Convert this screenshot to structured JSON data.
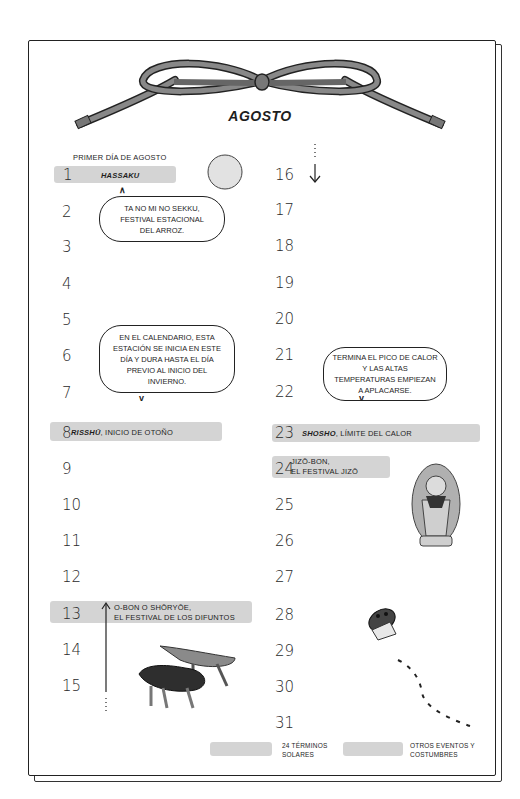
{
  "header": {
    "month": "AGOSTO"
  },
  "left_column": {
    "first_day_note": "PRIMER DÍA DE AGOSTO",
    "days": [
      "1",
      "2",
      "3",
      "4",
      "5",
      "6",
      "7",
      "8",
      "9",
      "10",
      "11",
      "12",
      "13",
      "14",
      "15"
    ],
    "events": {
      "day1": "HASSAKU",
      "day8_name": "RISSHŪ",
      "day8_rest": ", INICIO DE OTOÑO",
      "day13_line1": "O-BON O SHŌRYŌE,",
      "day13_line2": "EL FESTIVAL DE LOS DIFUNTOS"
    },
    "bubbles": {
      "hassaku": "TA NO MI NO SEKKU, FESTIVAL ESTACIONAL DEL ARROZ.",
      "risshu": "EN EL CALENDARIO, ESTA ESTACIÓN SE INICIA EN ESTE DÍA Y DURA HASTA EL DÍA PREVIO AL INICIO DEL INVIERNO."
    }
  },
  "right_column": {
    "days": [
      "16",
      "17",
      "18",
      "19",
      "20",
      "21",
      "22",
      "23",
      "24",
      "25",
      "26",
      "27",
      "28",
      "29",
      "30",
      "31"
    ],
    "events": {
      "day23_name": "SHOSHO",
      "day23_rest": ", LÍMITE DEL CALOR",
      "day24_line1": "JIZŌ-BON,",
      "day24_line2": "EL FESTIVAL JIZŌ"
    },
    "bubbles": {
      "shosho": "TERMINA EL PICO DE CALOR Y LAS ALTAS TEMPERATURAS EMPIEZAN A APLACARSE."
    }
  },
  "legend": {
    "item1": "24 TÉRMINOS SOLARES",
    "item2": "OTROS EVENTOS Y COSTUMBRES"
  },
  "colors": {
    "highlight": "#cfcfcf",
    "rope": "#777777",
    "ink": "#222222"
  }
}
